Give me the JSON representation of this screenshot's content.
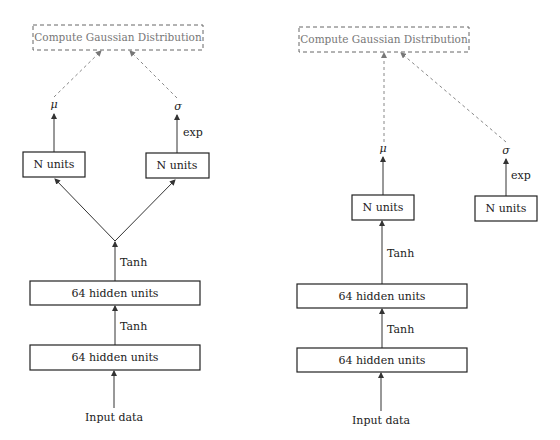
{
  "diagrams": [
    {
      "id": "left",
      "description": "Shared-branch policy network: two N-unit heads both fed from hidden layers",
      "output_box": "Compute Gaussian Distribution",
      "mu_label": "μ",
      "sigma_label": "σ",
      "exp_label": "exp",
      "head_mu": "N units",
      "head_sigma": "N units",
      "branch_activation": "Tanh",
      "hidden_2": "64 hidden units",
      "activation_2": "Tanh",
      "hidden_1": "64 hidden units",
      "input": "Input data"
    },
    {
      "id": "right",
      "description": "Policy network with independent (state-free) sigma head",
      "output_box": "Compute Gaussian Distribution",
      "mu_label": "μ",
      "sigma_label": "σ",
      "exp_label": "exp",
      "head_mu": "N units",
      "head_sigma": "N units",
      "branch_activation": "Tanh",
      "hidden_2": "64 hidden units",
      "activation_2": "Tanh",
      "hidden_1": "64 hidden units",
      "input": "Input data"
    }
  ],
  "colors": {
    "line": "#333333",
    "dashed": "#888888",
    "text": "#222222",
    "muted_text": "#777777"
  }
}
